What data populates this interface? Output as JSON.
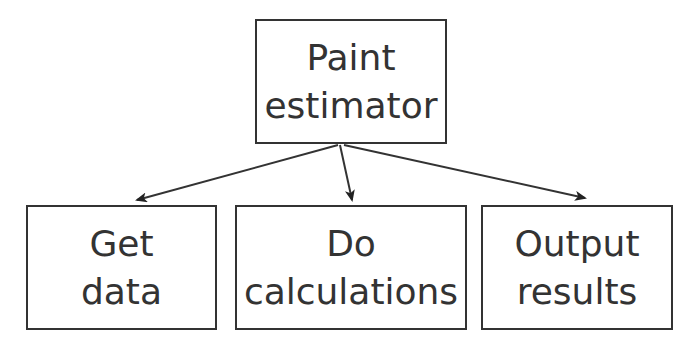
{
  "diagram": {
    "type": "hierarchy-chart",
    "root": {
      "lines": [
        "Paint",
        "estimator"
      ]
    },
    "children": [
      {
        "lines": [
          "Get",
          "data"
        ]
      },
      {
        "lines": [
          "Do",
          "calculations"
        ]
      },
      {
        "lines": [
          "Output",
          "results"
        ]
      }
    ],
    "edges": [
      {
        "from": "Paint estimator",
        "to": "Get data"
      },
      {
        "from": "Paint estimator",
        "to": "Do calculations"
      },
      {
        "from": "Paint estimator",
        "to": "Output results"
      }
    ],
    "colors": {
      "stroke": "#333333",
      "background": "#ffffff",
      "text": "#333333"
    }
  }
}
